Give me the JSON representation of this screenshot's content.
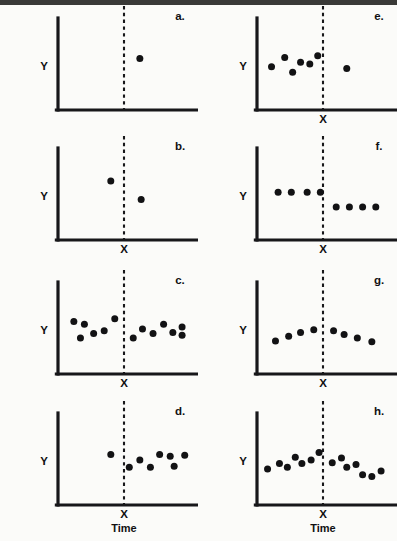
{
  "figure": {
    "title": "",
    "background_color": "#fbfbf9",
    "ink_color": "#121214",
    "columns": 2,
    "rows": 4
  },
  "labels": {
    "y_axis": "Y",
    "x_marker": "X",
    "time_axis": "Time"
  },
  "chart_data": {
    "type": "scatter",
    "title": "",
    "xlabel": "Time",
    "ylabel": "Y",
    "xlim": [
      0,
      100
    ],
    "ylim": [
      0,
      100
    ],
    "grid": false,
    "legend": "none",
    "annotations": [
      "Dashed vertical line marks intervention point X in every panel",
      "Each panel shows a different interrupted time-series data pattern"
    ],
    "intervention_x": 50,
    "panels": [
      {
        "id": "a",
        "label": "a.",
        "column": 0,
        "row": 0,
        "pattern": "single post-intervention observation only",
        "show_x_tick": false,
        "show_time_label": false,
        "points": [
          {
            "x": 62,
            "y": 56
          }
        ]
      },
      {
        "id": "b",
        "label": "b.",
        "column": 0,
        "row": 1,
        "pattern": "one pre point and one post point",
        "show_x_tick": true,
        "show_time_label": false,
        "points": [
          {
            "x": 40,
            "y": 64
          },
          {
            "x": 63,
            "y": 44
          }
        ]
      },
      {
        "id": "c",
        "label": "c.",
        "column": 0,
        "row": 2,
        "pattern": "stable scatter before and after, no change at X",
        "show_x_tick": true,
        "show_time_label": false,
        "points": [
          {
            "x": 12,
            "y": 57
          },
          {
            "x": 20,
            "y": 54
          },
          {
            "x": 27,
            "y": 44
          },
          {
            "x": 35,
            "y": 47
          },
          {
            "x": 43,
            "y": 60
          },
          {
            "x": 17,
            "y": 39
          },
          {
            "x": 57,
            "y": 39
          },
          {
            "x": 64,
            "y": 49
          },
          {
            "x": 72,
            "y": 44
          },
          {
            "x": 80,
            "y": 54
          },
          {
            "x": 87,
            "y": 45
          },
          {
            "x": 94,
            "y": 51
          },
          {
            "x": 94,
            "y": 42
          }
        ]
      },
      {
        "id": "d",
        "label": "d.",
        "column": 0,
        "row": 3,
        "pattern": "one pre point, several post points",
        "show_x_tick": true,
        "show_time_label": true,
        "points": [
          {
            "x": 40,
            "y": 55
          },
          {
            "x": 54,
            "y": 41
          },
          {
            "x": 62,
            "y": 49
          },
          {
            "x": 70,
            "y": 41
          },
          {
            "x": 77,
            "y": 55
          },
          {
            "x": 85,
            "y": 53
          },
          {
            "x": 88,
            "y": 42
          },
          {
            "x": 96,
            "y": 54
          }
        ]
      },
      {
        "id": "e",
        "label": "e.",
        "column": 1,
        "row": 0,
        "pattern": "several pre points scattered, single post point",
        "show_x_tick": true,
        "show_time_label": false,
        "points": [
          {
            "x": 11,
            "y": 47
          },
          {
            "x": 21,
            "y": 57
          },
          {
            "x": 27,
            "y": 41
          },
          {
            "x": 33,
            "y": 52
          },
          {
            "x": 40,
            "y": 50
          },
          {
            "x": 46,
            "y": 59
          },
          {
            "x": 68,
            "y": 45
          }
        ]
      },
      {
        "id": "f",
        "label": "f.",
        "column": 1,
        "row": 1,
        "pattern": "level shift downward at X, flat before and after",
        "show_x_tick": true,
        "show_time_label": false,
        "points": [
          {
            "x": 16,
            "y": 52
          },
          {
            "x": 26,
            "y": 52
          },
          {
            "x": 38,
            "y": 52
          },
          {
            "x": 48,
            "y": 52
          },
          {
            "x": 60,
            "y": 36
          },
          {
            "x": 70,
            "y": 36
          },
          {
            "x": 80,
            "y": 36
          },
          {
            "x": 90,
            "y": 36
          }
        ]
      },
      {
        "id": "g",
        "label": "g.",
        "column": 1,
        "row": 2,
        "pattern": "inverted U, rises to peak at X then declines",
        "show_x_tick": true,
        "show_time_label": false,
        "points": [
          {
            "x": 14,
            "y": 36
          },
          {
            "x": 24,
            "y": 41
          },
          {
            "x": 33,
            "y": 45
          },
          {
            "x": 43,
            "y": 48
          },
          {
            "x": 58,
            "y": 47
          },
          {
            "x": 66,
            "y": 43
          },
          {
            "x": 76,
            "y": 39
          },
          {
            "x": 87,
            "y": 35
          }
        ]
      },
      {
        "id": "h",
        "label": "h.",
        "column": 1,
        "row": 3,
        "pattern": "upward trend before X reversing to downward trend after",
        "show_x_tick": true,
        "show_time_label": true,
        "points": [
          {
            "x": 8,
            "y": 39
          },
          {
            "x": 17,
            "y": 45
          },
          {
            "x": 23,
            "y": 41
          },
          {
            "x": 29,
            "y": 52
          },
          {
            "x": 34,
            "y": 45
          },
          {
            "x": 41,
            "y": 49
          },
          {
            "x": 47,
            "y": 57
          },
          {
            "x": 57,
            "y": 46
          },
          {
            "x": 64,
            "y": 51
          },
          {
            "x": 68,
            "y": 41
          },
          {
            "x": 75,
            "y": 44
          },
          {
            "x": 80,
            "y": 33
          },
          {
            "x": 87,
            "y": 31
          },
          {
            "x": 94,
            "y": 37
          }
        ]
      }
    ]
  }
}
